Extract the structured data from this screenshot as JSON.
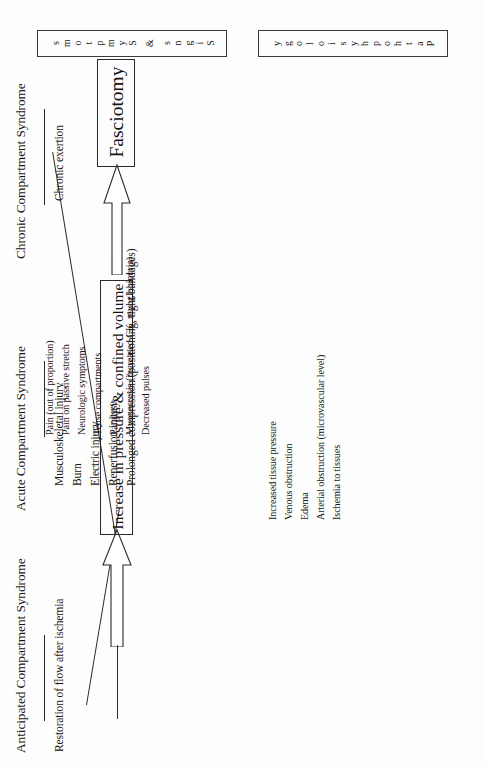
{
  "document": {
    "title": "Compartment Syndrome Flowchart",
    "orientation": "rotated-90-ccw",
    "background_color": "#fdfdfd",
    "ink_color": "#1a1a1a"
  },
  "columns": [
    {
      "id": "anticipated",
      "header": "Anticipated Compartment Syndrome",
      "items": [
        "Restoration of flow after ischemia"
      ]
    },
    {
      "id": "acute",
      "header": "Acute Compartment Syndrome",
      "items": [
        "Musculoskeletal injury",
        "Burn",
        "Electric injury",
        "Reperfusion injury",
        "Prolonged compression (positioning, tight bandages)"
      ]
    },
    {
      "id": "chronic",
      "header": "Chronic Compartment Syndrome",
      "items": [
        "Chronic exertion"
      ]
    }
  ],
  "center_node": {
    "label": "Increase in pressure & confined volume"
  },
  "outcome_node": {
    "label": "Fasciotomy"
  },
  "banners": {
    "signs": {
      "title": "Signs & Symptoms",
      "letters": [
        "S",
        "i",
        "g",
        "n",
        "s",
        " ",
        "&",
        " ",
        "S",
        "y",
        "m",
        "p",
        "t",
        "o",
        "m",
        "s"
      ]
    },
    "pathophysiology": {
      "title": "Pathophysiology",
      "letters": [
        "P",
        "a",
        "t",
        "h",
        "o",
        "p",
        "h",
        "y",
        "s",
        "i",
        "o",
        "l",
        "o",
        "g",
        "y"
      ]
    }
  },
  "signs_symptoms_list": [
    "Pain (out of proportion)",
    "Pain on passive stretch",
    "Neurologic symptoms",
    "Tense compartments",
    "Paralysis",
    "Myonecrosis (increased CK, myoglobinuria)",
    "Decreased pulses"
  ],
  "pathophysiology_list": [
    "Increased tissue pressure",
    "Venous obstruction",
    "Edema",
    "Arterial obstruction (microvascular level)",
    "Ischemia to tissues"
  ],
  "arrows": [
    {
      "id": "causes-to-center",
      "from": "causes",
      "to": "center_node",
      "style": "hollow-block"
    },
    {
      "id": "center-to-fasciotomy",
      "from": "center_node",
      "to": "outcome_node",
      "style": "hollow-block"
    }
  ]
}
